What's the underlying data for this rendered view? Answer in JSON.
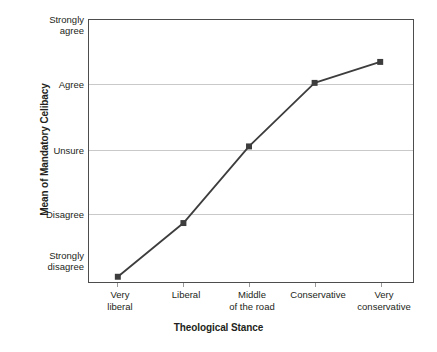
{
  "chart_data": {
    "type": "line",
    "title": "",
    "xlabel": "Theological Stance",
    "ylabel": "Mean of Mandatory Celibacy",
    "categories": [
      "Very\nliberal",
      "Liberal",
      "Middle\nof the road",
      "Conservative",
      "Very\nconservative"
    ],
    "category_labels": [
      {
        "line1": "Very",
        "line2": "liberal"
      },
      {
        "line1": "Liberal",
        "line2": ""
      },
      {
        "line1": "Middle",
        "line2": "of the road"
      },
      {
        "line1": "Conservative",
        "line2": ""
      },
      {
        "line1": "Very",
        "line2": "conservative"
      }
    ],
    "ytick_labels": [
      {
        "line1": "Strongly",
        "line2": "agree",
        "value": 5
      },
      {
        "line1": "Agree",
        "line2": "",
        "value": 4
      },
      {
        "line1": "Unsure",
        "line2": "",
        "value": 3
      },
      {
        "line1": "Disagree",
        "line2": "",
        "value": 2
      },
      {
        "line1": "Strongly",
        "line2": "disagree",
        "value": 1
      }
    ],
    "ylim": [
      1,
      5
    ],
    "values": [
      1.08,
      1.9,
      3.07,
      4.04,
      4.36
    ],
    "grid": true,
    "grid_axis": "y",
    "legend": "none",
    "marker": "filled-square",
    "line_color": "#3d3d3d",
    "grid_color": "#c9c9c9",
    "frame_color": "#4d4d4d",
    "background": "#ffffff"
  }
}
